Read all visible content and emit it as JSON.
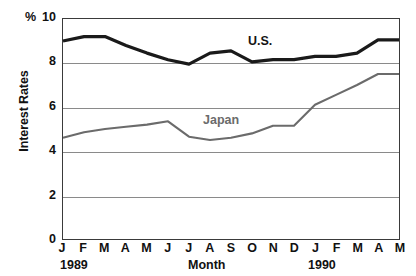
{
  "chart_data": {
    "type": "line",
    "title": "",
    "xlabel": "Month",
    "ylabel": "Interest Rates",
    "unit_label": "%",
    "ylim": [
      0,
      10
    ],
    "yticks": [
      0,
      2,
      4,
      6,
      8,
      10
    ],
    "ytick_labels": [
      "0",
      "2",
      "4",
      "6",
      "8",
      "10"
    ],
    "grid": true,
    "legend_position": "inline-labels",
    "categories": [
      "J",
      "F",
      "M",
      "A",
      "M",
      "J",
      "J",
      "A",
      "S",
      "O",
      "N",
      "D",
      "J",
      "F",
      "M",
      "A",
      "M"
    ],
    "period_labels": [
      "1989",
      "1990"
    ],
    "series": [
      {
        "name": "U.S.",
        "color": "#1a1a1a",
        "values": [
          9.0,
          9.2,
          9.2,
          8.8,
          8.45,
          8.15,
          7.95,
          8.45,
          8.55,
          8.05,
          8.15,
          8.15,
          8.3,
          8.3,
          8.45,
          9.05,
          9.05
        ]
      },
      {
        "name": "Japan",
        "color": "#6b6b6b",
        "values": [
          4.6,
          4.85,
          5.0,
          5.1,
          5.2,
          5.35,
          4.65,
          4.5,
          4.6,
          4.8,
          5.15,
          5.15,
          6.1,
          6.55,
          7.0,
          7.5,
          7.5
        ]
      }
    ]
  },
  "axis": {
    "percent_symbol": "%",
    "y_title": "Interest Rates",
    "x_title": "Month",
    "year_start": "1989",
    "year_end": "1990"
  },
  "series_labels": {
    "us": "U.S.",
    "japan": "Japan"
  }
}
